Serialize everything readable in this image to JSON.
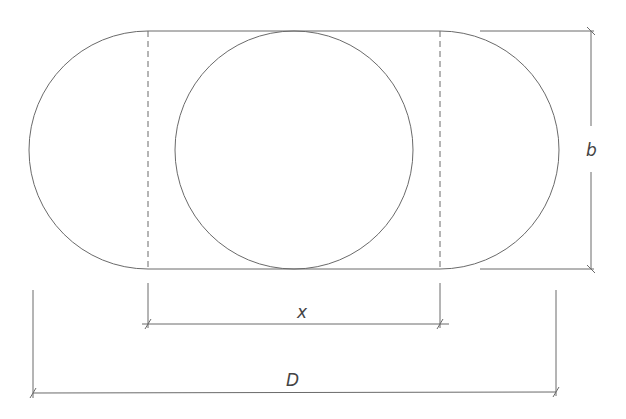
{
  "diagram": {
    "labels": {
      "height": "b",
      "center_distance": "x",
      "overall_length": "D"
    },
    "colors": {
      "line": "#666666",
      "background": "#ffffff"
    }
  }
}
